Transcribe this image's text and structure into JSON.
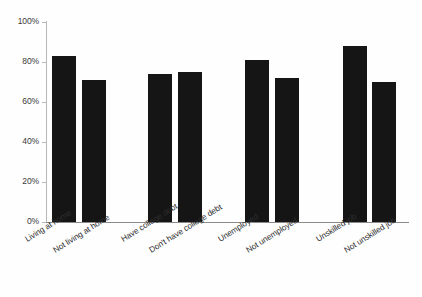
{
  "chart_data": {
    "type": "bar",
    "title": "",
    "subtitle": "",
    "xlabel": "",
    "ylabel": "",
    "ylim": [
      0,
      100
    ],
    "ytick_labels": [
      "100%",
      "80%",
      "60%",
      "40%",
      "20%",
      "0%"
    ],
    "ytick_values": [
      100,
      80,
      60,
      40,
      20,
      0
    ],
    "grid": false,
    "legend": "none",
    "bar_color": "#151515",
    "axis_color": "#b8b8b8",
    "categories": [
      "Living at home",
      "Not living at home",
      "Have college debt",
      "Don't have college debt",
      "Unemployed",
      "Not unemployed",
      "Unskilled job",
      "Not unskilled job"
    ],
    "values": [
      83,
      71,
      74,
      75,
      81,
      72,
      88,
      70
    ],
    "groups": [
      {
        "name": "Living at home",
        "categories": [
          "Living at home",
          "Not living at home"
        ],
        "values": [
          83,
          71
        ]
      },
      {
        "name": "College debt",
        "categories": [
          "Have college debt",
          "Don't have college debt"
        ],
        "values": [
          74,
          75
        ]
      },
      {
        "name": "Employment",
        "categories": [
          "Unemployed",
          "Not unemployed"
        ],
        "values": [
          81,
          72
        ]
      },
      {
        "name": "Job skill",
        "categories": [
          "Unskilled job",
          "Not unskilled job"
        ],
        "values": [
          88,
          70
        ]
      }
    ]
  }
}
